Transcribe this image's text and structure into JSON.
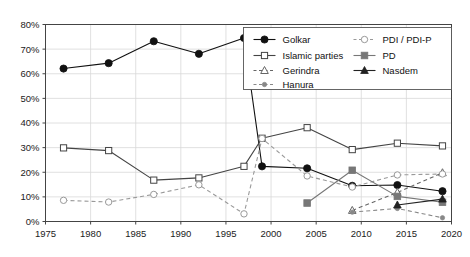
{
  "chart_data": {
    "type": "line",
    "title": "",
    "subtitle": "",
    "xlabel": "",
    "ylabel": "",
    "xlim": [
      1975,
      2020
    ],
    "ylim": [
      0,
      80
    ],
    "x_ticks": [
      1975,
      1980,
      1985,
      1990,
      1995,
      2000,
      2005,
      2010,
      2015,
      2020
    ],
    "x_tick_labels": [
      "1975",
      "1980",
      "1985",
      "1990",
      "1995",
      "2000",
      "2005",
      "2010",
      "2015",
      "2020"
    ],
    "y_ticks": [
      0,
      10,
      20,
      30,
      40,
      50,
      60,
      70,
      80
    ],
    "y_tick_labels": [
      "0%",
      "10%",
      "20%",
      "30%",
      "40%",
      "50%",
      "60%",
      "70%",
      "80%"
    ],
    "grid": "vertical-and-horizontal-light",
    "legend_position": "top-right-inside",
    "series": [
      {
        "name": "Golkar",
        "marker": "filled-circle",
        "line_style": "solid",
        "color": "#111111",
        "x": [
          1977,
          1982,
          1987,
          1992,
          1997,
          1999,
          2004,
          2009,
          2014,
          2019
        ],
        "values": [
          62.1,
          64.3,
          73.2,
          68.1,
          74.5,
          22.4,
          21.6,
          14.5,
          14.8,
          12.3
        ]
      },
      {
        "name": "Islamic parties",
        "marker": "open-square",
        "line_style": "solid",
        "color": "#444444",
        "x": [
          1977,
          1982,
          1987,
          1992,
          1997,
          1999,
          2004,
          2009,
          2014,
          2019
        ],
        "values": [
          29.9,
          28.8,
          16.8,
          17.7,
          22.4,
          33.8,
          38.1,
          29.2,
          31.8,
          30.7
        ]
      },
      {
        "name": "Gerindra",
        "marker": "open-triangle",
        "line_style": "dashed",
        "color": "#666666",
        "x": [
          2009,
          2014,
          2019
        ],
        "values": [
          4.5,
          11.8,
          19.8
        ]
      },
      {
        "name": "Hanura",
        "marker": "small-dot",
        "line_style": "dashed",
        "color": "#888888",
        "x": [
          2009,
          2014,
          2019
        ],
        "values": [
          3.8,
          5.3,
          1.5
        ]
      },
      {
        "name": "PDI / PDI-P",
        "marker": "open-circle",
        "line_style": "dashed",
        "color": "#999999",
        "x": [
          1977,
          1982,
          1987,
          1992,
          1997,
          1999,
          2004,
          2009,
          2014,
          2019
        ],
        "values": [
          8.6,
          7.9,
          11.0,
          14.9,
          3.1,
          33.7,
          18.5,
          14.0,
          18.9,
          19.3
        ]
      },
      {
        "name": "PD",
        "marker": "filled-square",
        "line_style": "solid",
        "color": "#777777",
        "x": [
          2004,
          2009,
          2014,
          2019
        ],
        "values": [
          7.5,
          20.8,
          10.2,
          7.8
        ]
      },
      {
        "name": "Nasdem",
        "marker": "filled-triangle",
        "line_style": "solid",
        "color": "#222222",
        "x": [
          2014,
          2019
        ],
        "values": [
          6.7,
          9.1
        ]
      }
    ],
    "legend_entries": [
      "Golkar",
      "Islamic parties",
      "Gerindra",
      "Hanura",
      "PDI / PDI-P",
      "PD",
      "Nasdem"
    ]
  }
}
